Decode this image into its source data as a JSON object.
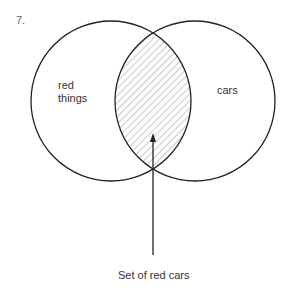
{
  "figure_number": "7.",
  "diagram": {
    "type": "venn",
    "sets": [
      {
        "label_line1": "red",
        "label_line2": "things"
      },
      {
        "label": "cars"
      }
    ],
    "intersection_label": "Set of red cars",
    "stroke_color": "#222222",
    "hatch_color": "#777777"
  }
}
